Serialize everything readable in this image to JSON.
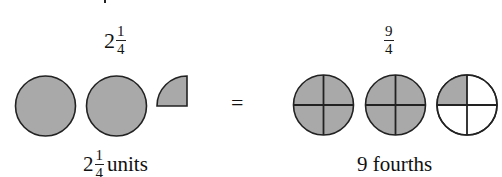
{
  "left": {
    "top_label": {
      "whole": "2",
      "numerator": "1",
      "denominator": "4"
    },
    "bottom_label": {
      "whole": "2",
      "numerator": "1",
      "denominator": "4",
      "unit": "units"
    },
    "shapes": [
      {
        "type": "full-circle",
        "shaded": true
      },
      {
        "type": "full-circle",
        "shaded": true
      },
      {
        "type": "quarter-circle",
        "shaded": true
      }
    ]
  },
  "operator": "=",
  "right": {
    "top_label": {
      "numerator": "9",
      "denominator": "4"
    },
    "bottom_label": "9 fourths",
    "shapes": [
      {
        "type": "circle-quarters",
        "shaded_quarters": 4
      },
      {
        "type": "circle-quarters",
        "shaded_quarters": 4
      },
      {
        "type": "circle-quarters",
        "shaded_quarters": 1
      }
    ]
  },
  "colors": {
    "shade": "#a9a9a9",
    "stroke": "#222222",
    "background": "#ffffff"
  }
}
